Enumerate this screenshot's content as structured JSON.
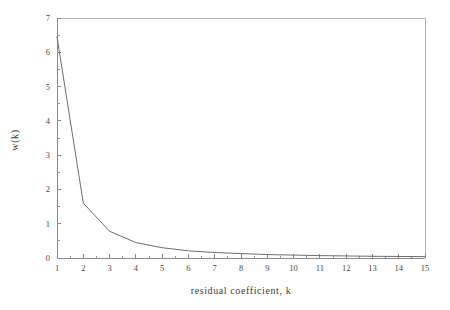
{
  "chart_data": {
    "type": "line",
    "title": "",
    "xlabel": "residual  coefficient,  k",
    "ylabel": "w(k)",
    "xlim": [
      1,
      15
    ],
    "ylim": [
      0,
      7
    ],
    "grid": false,
    "legend": "none",
    "x_ticks": [
      "1",
      "2",
      "3",
      "4",
      "5",
      "6",
      "7",
      "8",
      "9",
      "10",
      "11",
      "12",
      "13",
      "14",
      "15"
    ],
    "y_ticks": [
      "0",
      "1",
      "2",
      "3",
      "4",
      "5",
      "6",
      "7"
    ],
    "x_minor_per_interval": 1,
    "y_minor_per_interval": 1,
    "x": [
      1,
      2,
      3,
      4,
      5,
      6,
      7,
      8,
      9,
      10,
      11,
      12,
      13,
      14,
      15
    ],
    "values": [
      6.45,
      1.6,
      0.78,
      0.45,
      0.3,
      0.21,
      0.16,
      0.13,
      0.1,
      0.085,
      0.07,
      0.06,
      0.05,
      0.045,
      0.04
    ],
    "series": [
      {
        "name": "w(k)",
        "values": [
          6.45,
          1.6,
          0.78,
          0.45,
          0.3,
          0.21,
          0.16,
          0.13,
          0.1,
          0.085,
          0.07,
          0.06,
          0.05,
          0.045,
          0.04
        ]
      }
    ],
    "colors": {
      "line": "#6e6e6e",
      "axis": "#8a8a8a",
      "frame": "#b4b4b4",
      "text": "#3c3c3c",
      "background": "#ffffff"
    }
  }
}
